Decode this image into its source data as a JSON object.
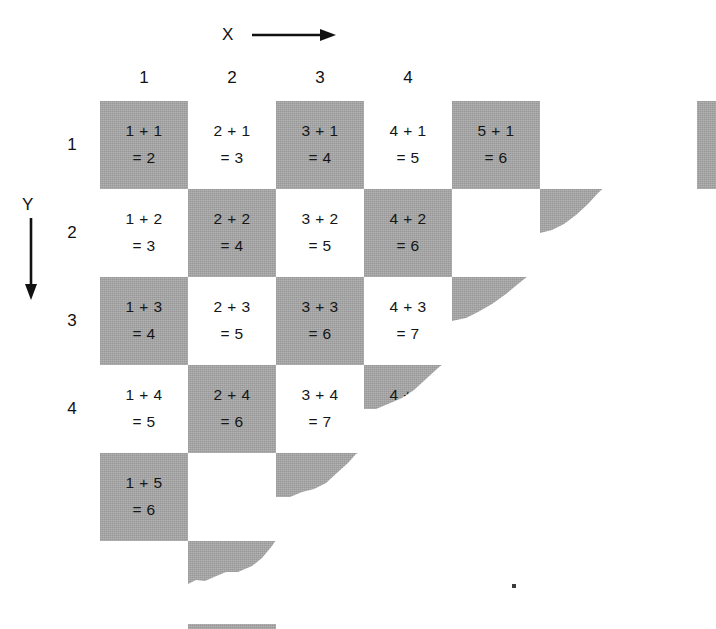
{
  "figure": {
    "type": "addition-table-checkerboard",
    "x_axis": {
      "label": "X",
      "arrow": "arrow-right-icon",
      "direction": "right"
    },
    "y_axis": {
      "label": "Y",
      "arrow": "arrow-down-icon",
      "direction": "down"
    },
    "column_headers": [
      "1",
      "2",
      "3",
      "4"
    ],
    "row_headers": [
      "1",
      "2",
      "3",
      "4"
    ],
    "grid": {
      "cell_size_px": 88,
      "origin_x_px": 100,
      "origin_y_px": 101,
      "columns": 7,
      "rows": 6,
      "shade_rule": "shaded when (column + row) is even",
      "shaded_color": "#a3a3a3",
      "blank_color": "#ffffff",
      "edge_style": "torn-paper"
    },
    "cells": [
      {
        "col": 1,
        "row": 1,
        "shaded": true,
        "line1": "1 + 1",
        "line2": "= 2"
      },
      {
        "col": 2,
        "row": 1,
        "shaded": false,
        "line1": "2 + 1",
        "line2": "= 3"
      },
      {
        "col": 3,
        "row": 1,
        "shaded": true,
        "line1": "3 + 1",
        "line2": "= 4"
      },
      {
        "col": 4,
        "row": 1,
        "shaded": false,
        "line1": "4 + 1",
        "line2": "= 5"
      },
      {
        "col": 5,
        "row": 1,
        "shaded": true,
        "line1": "5 + 1",
        "line2": "= 6"
      },
      {
        "col": 6,
        "row": 1,
        "shaded": false,
        "line1": "",
        "line2": ""
      },
      {
        "col": 7,
        "row": 1,
        "shaded": true,
        "line1": "",
        "line2": ""
      },
      {
        "col": 1,
        "row": 2,
        "shaded": false,
        "line1": "1 + 2",
        "line2": "= 3"
      },
      {
        "col": 2,
        "row": 2,
        "shaded": true,
        "line1": "2 + 2",
        "line2": "= 4"
      },
      {
        "col": 3,
        "row": 2,
        "shaded": false,
        "line1": "3 + 2",
        "line2": "= 5"
      },
      {
        "col": 4,
        "row": 2,
        "shaded": true,
        "line1": "4 + 2",
        "line2": "= 6"
      },
      {
        "col": 5,
        "row": 2,
        "shaded": false,
        "line1": "",
        "line2": ""
      },
      {
        "col": 6,
        "row": 2,
        "shaded": true,
        "line1": "",
        "line2": ""
      },
      {
        "col": 1,
        "row": 3,
        "shaded": true,
        "line1": "1 + 3",
        "line2": "= 4"
      },
      {
        "col": 2,
        "row": 3,
        "shaded": false,
        "line1": "2 + 3",
        "line2": "= 5"
      },
      {
        "col": 3,
        "row": 3,
        "shaded": true,
        "line1": "3 + 3",
        "line2": "= 6"
      },
      {
        "col": 4,
        "row": 3,
        "shaded": false,
        "line1": "4 + 3",
        "line2": "= 7"
      },
      {
        "col": 5,
        "row": 3,
        "shaded": true,
        "line1": "",
        "line2": ""
      },
      {
        "col": 1,
        "row": 4,
        "shaded": false,
        "line1": "1 + 4",
        "line2": "= 5"
      },
      {
        "col": 2,
        "row": 4,
        "shaded": true,
        "line1": "2 + 4",
        "line2": "= 6"
      },
      {
        "col": 3,
        "row": 4,
        "shaded": false,
        "line1": "3 + 4",
        "line2": "= 7"
      },
      {
        "col": 4,
        "row": 4,
        "shaded": true,
        "line1": "4 + 4",
        "line2": "= 8"
      },
      {
        "col": 1,
        "row": 5,
        "shaded": true,
        "line1": "1 + 5",
        "line2": "= 6"
      },
      {
        "col": 2,
        "row": 5,
        "shaded": false,
        "line1": "",
        "line2": ""
      },
      {
        "col": 3,
        "row": 5,
        "shaded": true,
        "line1": "",
        "line2": ""
      },
      {
        "col": 2,
        "row": 6,
        "shaded": true,
        "line1": "",
        "line2": ""
      }
    ]
  }
}
